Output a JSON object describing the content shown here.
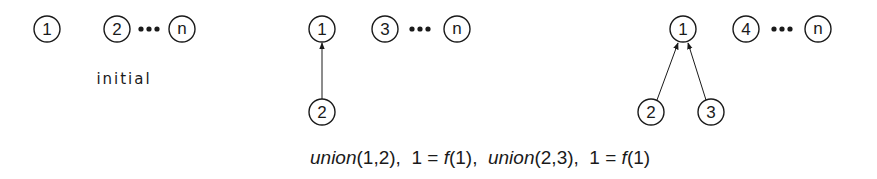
{
  "diagram": {
    "colors": {
      "ink": "#1a1a1a",
      "background": "#ffffff"
    },
    "panels": [
      {
        "id": "initial",
        "label": "initial",
        "nodes": [
          {
            "id": "p1-n1",
            "text": "1",
            "x": 47,
            "y": 29
          },
          {
            "id": "p1-n2",
            "text": "2",
            "x": 117,
            "y": 29
          },
          {
            "id": "p1-nn",
            "text": "n",
            "x": 182,
            "y": 29
          }
        ],
        "ellipsis": {
          "x": 149,
          "y": 29
        },
        "edges": []
      },
      {
        "id": "after-union-1-2",
        "label": "",
        "nodes": [
          {
            "id": "p2-n1",
            "text": "1",
            "x": 322,
            "y": 29
          },
          {
            "id": "p2-n3",
            "text": "3",
            "x": 385,
            "y": 29
          },
          {
            "id": "p2-nn",
            "text": "n",
            "x": 457,
            "y": 29
          },
          {
            "id": "p2-n2",
            "text": "2",
            "x": 322,
            "y": 112
          }
        ],
        "ellipsis": {
          "x": 420,
          "y": 29
        },
        "edges": [
          {
            "from": "2",
            "to": "1"
          }
        ]
      },
      {
        "id": "after-union-2-3",
        "label": "",
        "nodes": [
          {
            "id": "p3-n1",
            "text": "1",
            "x": 683,
            "y": 29
          },
          {
            "id": "p3-n4",
            "text": "4",
            "x": 746,
            "y": 29
          },
          {
            "id": "p3-nn",
            "text": "n",
            "x": 818,
            "y": 29
          },
          {
            "id": "p3-n2",
            "text": "2",
            "x": 651,
            "y": 112
          },
          {
            "id": "p3-n3",
            "text": "3",
            "x": 711,
            "y": 112
          }
        ],
        "ellipsis": {
          "x": 782,
          "y": 29
        },
        "edges": [
          {
            "from": "2",
            "to": "1"
          },
          {
            "from": "3",
            "to": "1"
          }
        ]
      }
    ],
    "caption": {
      "parts": [
        {
          "text": "union",
          "italic": true
        },
        {
          "text": "(1,2),  1 = ",
          "italic": false
        },
        {
          "text": "f",
          "italic": true
        },
        {
          "text": "(1),  ",
          "italic": false
        },
        {
          "text": "union",
          "italic": true
        },
        {
          "text": "(2,3),  1 = ",
          "italic": false
        },
        {
          "text": "f",
          "italic": true
        },
        {
          "text": "(1)",
          "italic": false
        }
      ]
    }
  }
}
